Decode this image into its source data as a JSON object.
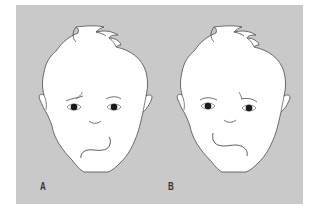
{
  "figure": {
    "background_color": "#c9c9c9",
    "face_fill": "#ffffff",
    "line_color": "#4a4a4a",
    "panels": [
      {
        "label": "A",
        "description": "Infant face with left lower lip asymmetry; mouth droops on the left side with raised brow on left"
      },
      {
        "label": "B",
        "description": "Infant face with right lower lip asymmetry; mouth droops on the right side with raised brow on right"
      }
    ]
  }
}
